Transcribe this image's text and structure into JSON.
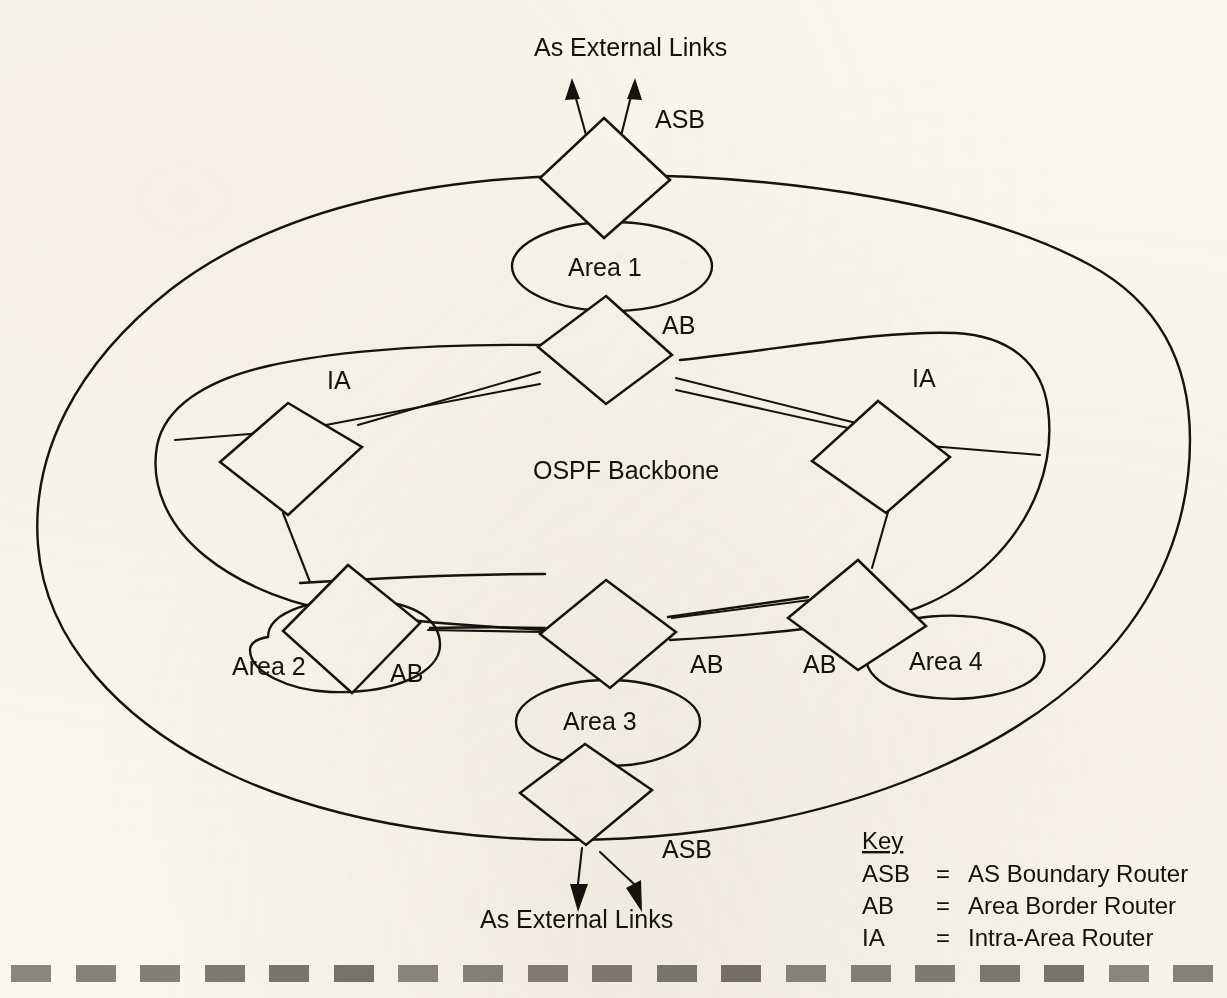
{
  "diagram": {
    "title_visible": false,
    "background_color": "#faf7f0",
    "ink_color": "#15120f",
    "backbone_label": "OSPF Backbone",
    "external_links_top": "As External Links",
    "external_links_bottom": "As External Links",
    "areas": [
      {
        "id": "area1",
        "label": "Area 1"
      },
      {
        "id": "area2",
        "label": "Area 2"
      },
      {
        "id": "area3",
        "label": "Area 3"
      },
      {
        "id": "area4",
        "label": "Area 4"
      }
    ],
    "routers": [
      {
        "id": "asb-top",
        "tag": "ASB",
        "type": "as-boundary-router"
      },
      {
        "id": "ab-area1",
        "tag": "AB",
        "type": "area-border-router"
      },
      {
        "id": "ia-left",
        "tag": "IA",
        "type": "intra-area-router"
      },
      {
        "id": "ia-right",
        "tag": "IA",
        "type": "intra-area-router"
      },
      {
        "id": "ab-area2",
        "tag": "AB",
        "type": "area-border-router"
      },
      {
        "id": "ab-area3",
        "tag": "AB",
        "type": "area-border-router"
      },
      {
        "id": "ab-area4",
        "tag": "AB",
        "type": "area-border-router"
      },
      {
        "id": "asb-bottom",
        "tag": "ASB",
        "type": "as-boundary-router"
      }
    ]
  },
  "key": {
    "title": "Key",
    "rows": [
      {
        "abbr": "ASB",
        "eq": "=",
        "meaning": "AS Boundary Router"
      },
      {
        "abbr": "AB",
        "eq": "=",
        "meaning": "Area Border Router"
      },
      {
        "abbr": "IA",
        "eq": "=",
        "meaning": "Intra-Area Router"
      }
    ]
  },
  "bottom_strip": {
    "dash_color": "#6e6a63",
    "dash_count": 19
  }
}
